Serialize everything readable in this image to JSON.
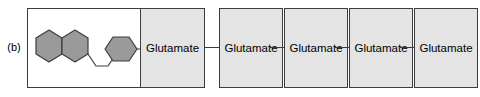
{
  "figure": {
    "panel_label": "(b)",
    "type": "polyglutamate-conjugate-chain-diagram",
    "colors": {
      "residue_fill": "#e4e4e4",
      "ring_fill": "#9a9a9a",
      "outline": "#3c3c3c",
      "structure_pane_fill": "#ffffff",
      "page_background": "#ffffff",
      "text": "#000000"
    },
    "structure": {
      "name": "aromatic-bicyclic-and-monocyclic-ring-system",
      "fused_ring_name": "naphthalene-fused-bicyclic-ring",
      "single_ring_name": "benzene-ring",
      "linker_name": "zigzag-alkyl-linker",
      "tail_bond_name": "ring-to-residue-bond"
    },
    "units": [
      {
        "id": "unit-1",
        "label": "Glutamate",
        "has_structure": true
      },
      {
        "id": "unit-2",
        "label": "Glutamate",
        "has_structure": false
      },
      {
        "id": "unit-3",
        "label": "Glutamate",
        "has_structure": false
      },
      {
        "id": "unit-4",
        "label": "Glutamate",
        "has_structure": false
      },
      {
        "id": "unit-5",
        "label": "Glutamate",
        "has_structure": false
      }
    ],
    "connector_count": 4
  }
}
